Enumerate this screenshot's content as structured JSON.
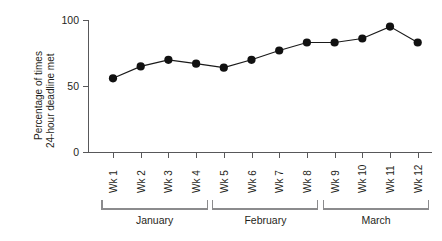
{
  "chart_data": {
    "type": "line",
    "title": "",
    "subtitle": "",
    "xlabel": "",
    "ylabel_line1": "Percentage of times",
    "ylabel_line2": "24-hour deadline met",
    "categories": [
      "Wk 1",
      "Wk 2",
      "Wk 3",
      "Wk 4",
      "Wk 5",
      "Wk 6",
      "Wk 7",
      "Wk 8",
      "Wk 9",
      "Wk 10",
      "Wk 11",
      "Wk 12"
    ],
    "values": [
      56,
      65,
      70,
      67,
      64,
      70,
      77,
      83,
      83,
      86,
      95,
      83
    ],
    "series": [
      {
        "name": "Percentage of times 24-hour deadline met",
        "values": [
          56,
          65,
          70,
          67,
          64,
          70,
          77,
          83,
          83,
          86,
          95,
          83
        ]
      }
    ],
    "ylim": [
      0,
      100
    ],
    "ytick_labels": [
      "0",
      "50",
      "100"
    ],
    "ytick_values": [
      0,
      50,
      100
    ],
    "grid": false,
    "legend": false,
    "legend_position": "none",
    "marker": "filled-circle",
    "marker_color": "#111111",
    "line_color": "#1a1a1a",
    "axis_color": "#58585a",
    "bracket_color": "#8b8b8d",
    "groups": [
      {
        "label": "January",
        "categories": [
          "Wk 1",
          "Wk 2",
          "Wk 3",
          "Wk 4"
        ]
      },
      {
        "label": "February",
        "categories": [
          "Wk 5",
          "Wk 6",
          "Wk 7",
          "Wk 8"
        ]
      },
      {
        "label": "March",
        "categories": [
          "Wk 9",
          "Wk 10",
          "Wk 11",
          "Wk 12"
        ]
      }
    ]
  }
}
